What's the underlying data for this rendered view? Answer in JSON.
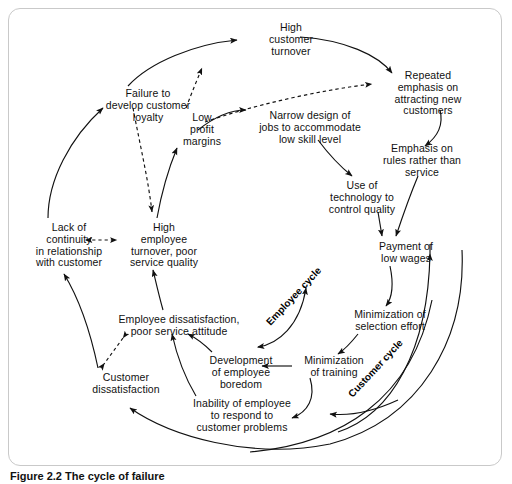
{
  "figure": {
    "caption": "Figure 2.2 The cycle of failure",
    "frame_color": "#c9c9c9",
    "line_color": "#111111",
    "background": "#ffffff"
  },
  "diagram": {
    "type": "causal-loop-diagram",
    "title": "The cycle of failure",
    "nodes": [
      {
        "id": "high-customer-turnover",
        "label": "High\ncustomer\nturnover",
        "x": 248,
        "y": 22,
        "w": 86
      },
      {
        "id": "repeated-emphasis",
        "label": "Repeated\nemphasis on\nattracting new\ncustomers",
        "x": 378,
        "y": 70,
        "w": 100
      },
      {
        "id": "failure-develop-loyalty",
        "label": "Failure to\ndevelop customer\nloyalty",
        "x": 92,
        "y": 88,
        "w": 112
      },
      {
        "id": "low-profit-margins",
        "label": "Low\nprofit\nmargins",
        "x": 174,
        "y": 112,
        "w": 56
      },
      {
        "id": "narrow-design-jobs",
        "label": "Narrow design of\njobs to accommodate\nlow skill level",
        "x": 244,
        "y": 110,
        "w": 132
      },
      {
        "id": "emphasis-rules",
        "label": "Emphasis on\nrules rather than\nservice",
        "x": 370,
        "y": 143,
        "w": 104
      },
      {
        "id": "use-of-technology",
        "label": "Use of\ntechnology to\ncontrol quality",
        "x": 318,
        "y": 180,
        "w": 88
      },
      {
        "id": "lack-of-continuity",
        "label": "Lack of\ncontinuity\nin relationship\nwith customer",
        "x": 22,
        "y": 222,
        "w": 94
      },
      {
        "id": "high-employee-turnover",
        "label": "High\nemployee\nturnover, poor\nservice quality",
        "x": 118,
        "y": 222,
        "w": 92
      },
      {
        "id": "payment-low-wages",
        "label": "Payment of\nlow wages",
        "x": 366,
        "y": 241,
        "w": 80
      },
      {
        "id": "employee-dissatisfaction",
        "label": "Employee dissatisfaction,\npoor service attitude",
        "x": 106,
        "y": 314,
        "w": 146
      },
      {
        "id": "minimization-selection",
        "label": "Minimization of\nselection effort",
        "x": 340,
        "y": 309,
        "w": 100
      },
      {
        "id": "development-boredom",
        "label": "Development\nof employee\nboredom",
        "x": 200,
        "y": 355,
        "w": 82
      },
      {
        "id": "minimization-training",
        "label": "Minimization\nof training",
        "x": 294,
        "y": 355,
        "w": 80
      },
      {
        "id": "customer-dissatisfaction",
        "label": "Customer\ndissatisfaction",
        "x": 80,
        "y": 372,
        "w": 92
      },
      {
        "id": "inability-to-respond",
        "label": "Inability of employee\nto respond to\ncustomer problems",
        "x": 180,
        "y": 398,
        "w": 124
      }
    ],
    "cycle_labels": [
      {
        "id": "employee-cycle",
        "label": "Employee cycle",
        "x": 268,
        "y": 318,
        "rotation": -47
      },
      {
        "id": "customer-cycle",
        "label": "Customer cycle",
        "x": 350,
        "y": 390,
        "rotation": -47
      }
    ],
    "edges": [
      {
        "from": "failure-develop-loyalty",
        "to": "high-customer-turnover",
        "style": "solid"
      },
      {
        "from": "high-customer-turnover",
        "to": "repeated-emphasis",
        "style": "solid"
      },
      {
        "from": "low-profit-margins",
        "to": "high-customer-turnover",
        "style": "dashed"
      },
      {
        "from": "low-profit-margins",
        "to": "repeated-emphasis",
        "style": "dashed"
      },
      {
        "from": "low-profit-margins",
        "to": "narrow-design-jobs",
        "style": "solid"
      },
      {
        "from": "failure-develop-loyalty",
        "to": "high-employee-turnover",
        "style": "dashed"
      },
      {
        "from": "lack-of-continuity",
        "to": "failure-develop-loyalty",
        "style": "solid"
      },
      {
        "from": "high-employee-turnover",
        "to": "low-profit-margins",
        "style": "solid"
      },
      {
        "from": "lack-of-continuity",
        "to": "high-employee-turnover",
        "style": "dashed-bidirectional"
      },
      {
        "from": "repeated-emphasis",
        "to": "emphasis-rules",
        "style": "solid"
      },
      {
        "from": "narrow-design-jobs",
        "to": "use-of-technology",
        "style": "solid"
      },
      {
        "from": "use-of-technology",
        "to": "payment-low-wages",
        "style": "solid"
      },
      {
        "from": "emphasis-rules",
        "to": "payment-low-wages",
        "style": "solid"
      },
      {
        "from": "payment-low-wages",
        "to": "minimization-selection",
        "style": "solid"
      },
      {
        "from": "minimization-selection",
        "to": "minimization-training",
        "style": "solid"
      },
      {
        "from": "minimization-training",
        "to": "development-boredom",
        "style": "solid"
      },
      {
        "from": "minimization-training",
        "to": "inability-to-respond",
        "style": "solid"
      },
      {
        "from": "development-boredom",
        "to": "employee-dissatisfaction",
        "style": "solid"
      },
      {
        "from": "inability-to-respond",
        "to": "employee-dissatisfaction",
        "style": "solid"
      },
      {
        "from": "employee-dissatisfaction",
        "to": "high-employee-turnover",
        "style": "solid"
      },
      {
        "from": "employee-dissatisfaction",
        "to": "customer-dissatisfaction",
        "style": "dashed-bidirectional"
      },
      {
        "from": "customer-dissatisfaction",
        "to": "lack-of-continuity",
        "style": "solid"
      },
      {
        "from": "employee-cycle-arc",
        "to": "employee-dissatisfaction",
        "style": "solid-bidirectional"
      },
      {
        "from": "customer-cycle-arc",
        "to": "inability-to-respond",
        "style": "solid"
      },
      {
        "from": "outer-arc",
        "to": "customer-dissatisfaction",
        "style": "solid"
      }
    ]
  }
}
